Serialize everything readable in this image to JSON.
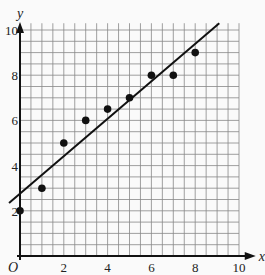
{
  "chart_data": {
    "type": "scatter",
    "title": "",
    "xlabel": "x",
    "ylabel": "y",
    "origin_label": "O",
    "xlim": [
      0,
      10
    ],
    "ylim": [
      0,
      10
    ],
    "grid": true,
    "grid_step": 0.5,
    "x_ticks": [
      "2",
      "4",
      "6",
      "8",
      "10"
    ],
    "y_ticks": [
      "2",
      "4",
      "6",
      "8",
      "10"
    ],
    "points": [
      {
        "x": 0,
        "y": 2
      },
      {
        "x": 1,
        "y": 3
      },
      {
        "x": 2,
        "y": 5
      },
      {
        "x": 3,
        "y": 6
      },
      {
        "x": 4,
        "y": 6.5
      },
      {
        "x": 5,
        "y": 7
      },
      {
        "x": 6,
        "y": 8
      },
      {
        "x": 7,
        "y": 8
      },
      {
        "x": 8,
        "y": 9
      }
    ],
    "best_fit_line": {
      "x1": -0.5,
      "y1": 2.35,
      "x2": 9.1,
      "y2": 10.3
    },
    "colors": {
      "grid": "#888888",
      "axes": "#111111",
      "points": "#111111",
      "line": "#111111"
    }
  }
}
